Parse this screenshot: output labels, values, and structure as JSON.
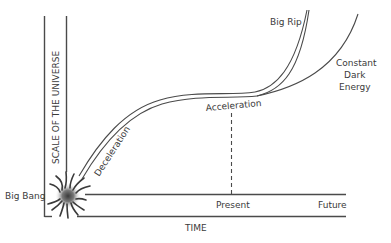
{
  "diagram": {
    "y_axis_label": "SCALE OF THE UNIVERSE",
    "x_axis_label": "TIME",
    "labels": {
      "origin": "Big Bang",
      "deceleration": "Deceleration",
      "acceleration": "Acceleration",
      "present": "Present",
      "future": "Future",
      "big_rip": "Big Rip",
      "constant_dark_energy_line1": "Constant",
      "constant_dark_energy_line2": "Dark",
      "constant_dark_energy_line3": "Energy"
    },
    "colors": {
      "line": "#4a4a4a",
      "text": "#3a3a3a",
      "background": "#ffffff"
    }
  }
}
